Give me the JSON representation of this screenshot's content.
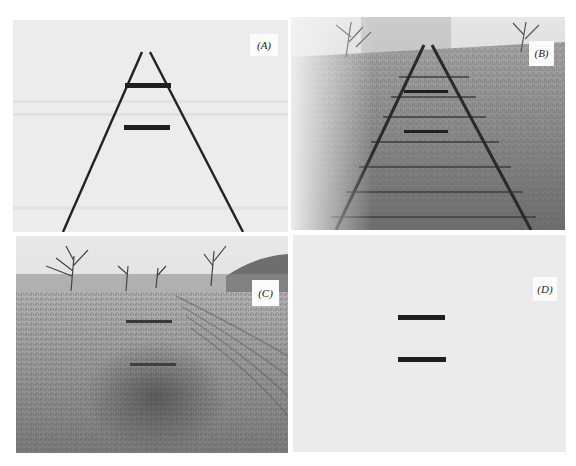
{
  "figure": {
    "panels": [
      {
        "id": "A",
        "label": "(A)",
        "content": "Two equal black bars between two converging lines (line-drawing Ponzo illusion)"
      },
      {
        "id": "B",
        "label": "(B)",
        "content": "Photograph of railroad tracks receding into distance with two equal bars superimposed"
      },
      {
        "id": "C",
        "label": "(C)",
        "content": "Photograph of a grassy field with trees, with two equal bars superimposed"
      },
      {
        "id": "D",
        "label": "(D)",
        "content": "Two equal black bars on a plain gray background (control)"
      }
    ]
  },
  "colors": {
    "page_bg": "#ffffff",
    "panel_a_bg": "#ececec",
    "panel_d_bg": "#ebebeb",
    "bar": "#1f1f1f",
    "line": "#222222"
  }
}
